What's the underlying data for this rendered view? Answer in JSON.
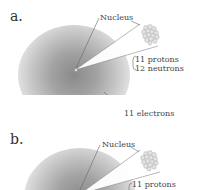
{
  "figure": {
    "panels": [
      {
        "label": "a.",
        "nucleus_label": "Nucleus",
        "protons": "11 protons",
        "neutrons": "12 neutrons",
        "electrons": "11 electrons"
      },
      {
        "label": "b.",
        "nucleus_label": "Nucleus",
        "protons": "11 protons"
      }
    ],
    "colors": {
      "cloud_center": "#8a8a8a",
      "cloud_edge": "#e8e8e8",
      "text": "#444444"
    }
  }
}
